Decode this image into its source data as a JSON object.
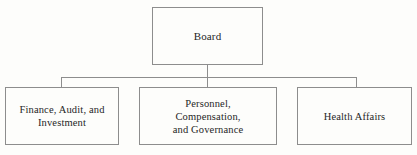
{
  "diagram": {
    "type": "organizational-chart",
    "orientation": "top-down",
    "levels": 2,
    "line_color": "#8d8d8d",
    "background_color": "#fdfdfb",
    "text_color": "#262626"
  },
  "nodes": {
    "root": {
      "id": "board",
      "label": "Board"
    },
    "children": [
      {
        "id": "finance",
        "label": "Finance, Audit, and\nInvestment"
      },
      {
        "id": "personnel",
        "label": "Personnel,\nCompensation,\nand Governance"
      },
      {
        "id": "health",
        "label": "Health Affairs"
      }
    ]
  },
  "connectors": {
    "board_stem": "vertical-line-from-board",
    "bus": "horizontal-distribution-bus",
    "drop_finance": "vertical-drop-to-finance",
    "drop_personnel": "vertical-drop-to-personnel",
    "drop_health": "vertical-drop-to-health"
  }
}
